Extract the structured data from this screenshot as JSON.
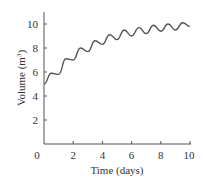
{
  "chart_data": {
    "type": "line",
    "title": "",
    "xlabel": "Time (days)",
    "ylabel": "Volume (m³)",
    "xlim": [
      0,
      10
    ],
    "ylim": [
      0,
      11
    ],
    "grid": false,
    "x_ticks": [
      0,
      2,
      4,
      6,
      8,
      10
    ],
    "y_ticks": [
      2,
      4,
      6,
      8,
      10
    ],
    "x_tick_labels": [
      "0",
      "2",
      "4",
      "6",
      "8",
      "10"
    ],
    "y_tick_labels": [
      "2",
      "4",
      "6",
      "8",
      "10"
    ],
    "series": [
      {
        "name": "Volume",
        "color": "#555555",
        "x": [
          0,
          0.5,
          1,
          1.5,
          2,
          2.5,
          3,
          3.5,
          4,
          4.5,
          5,
          5.5,
          6,
          6.5,
          7,
          7.5,
          8,
          8.5,
          9,
          9.5,
          10
        ],
        "values": [
          5.0,
          5.9,
          5.8,
          7.1,
          7.0,
          8.0,
          7.7,
          8.6,
          8.3,
          9.1,
          8.7,
          9.5,
          9.0,
          9.7,
          9.2,
          9.9,
          9.4,
          10.0,
          9.5,
          10.1,
          9.8
        ]
      }
    ]
  },
  "axes": {
    "xlabel": "Time (days)",
    "ylabel_main": "Volume (m",
    "ylabel_sup": "3",
    "ylabel_close": ")",
    "x_ticks": [
      "0",
      "2",
      "4",
      "6",
      "8",
      "10"
    ],
    "y_ticks": [
      "2",
      "4",
      "6",
      "8",
      "10"
    ]
  }
}
